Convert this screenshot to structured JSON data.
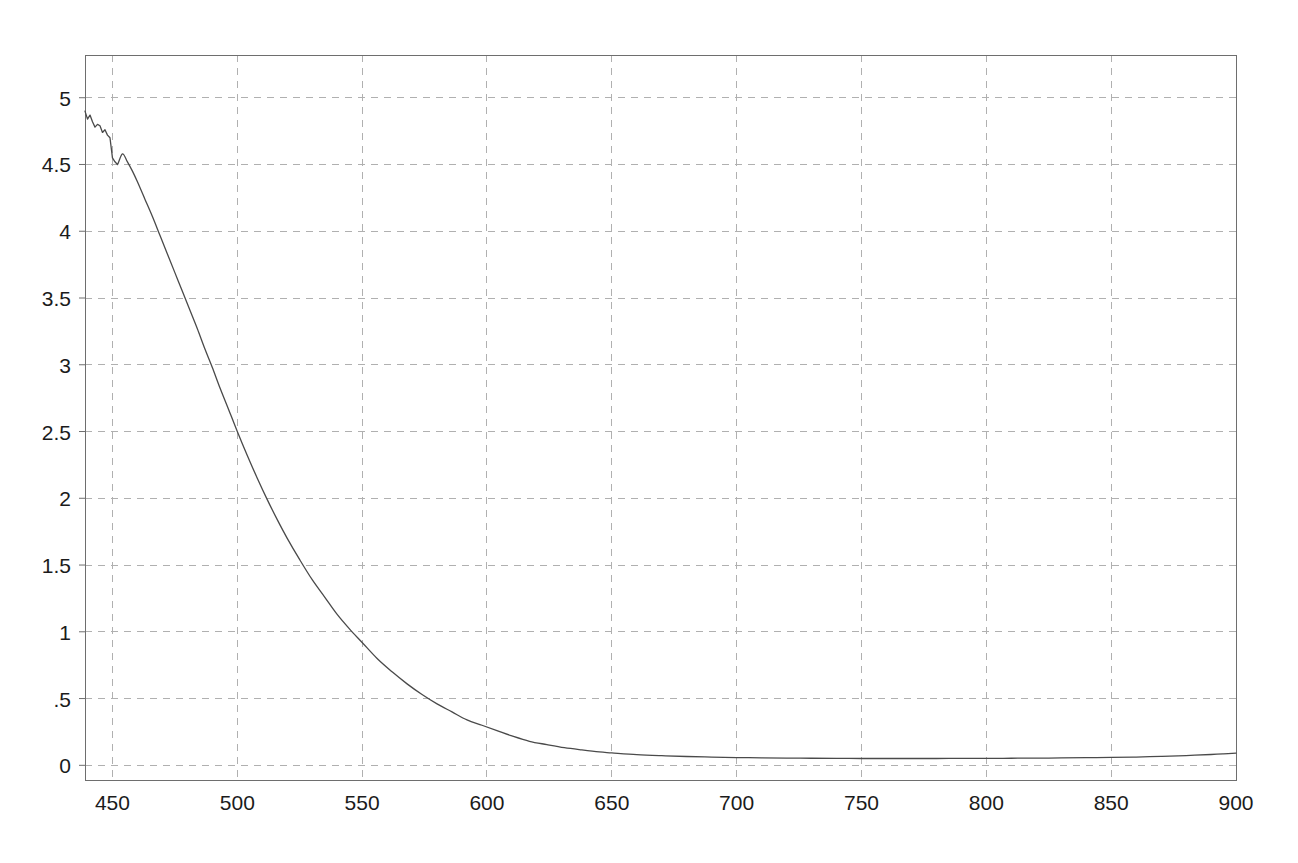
{
  "chart_data": {
    "type": "line",
    "title": "",
    "subtitle": "",
    "xlabel": "",
    "ylabel": "",
    "xlim": [
      439,
      900
    ],
    "ylim": [
      -0.11,
      5.32
    ],
    "grid": true,
    "grid_style": "dashed",
    "grid_color": "#b0b0b0",
    "legend": "none",
    "line_color": "#4a4a4a",
    "line_width": 1.3,
    "background": "#ffffff",
    "frame_color": "#6e6e6e",
    "xticks": [
      450,
      500,
      550,
      600,
      650,
      700,
      750,
      800,
      850,
      900
    ],
    "xtick_labels": [
      "450",
      "500",
      "550",
      "600",
      "650",
      "700",
      "750",
      "800",
      "850",
      "900"
    ],
    "yticks": [
      0,
      0.5,
      1,
      1.5,
      2,
      2.5,
      3,
      3.5,
      4,
      4.5,
      5
    ],
    "ytick_labels": [
      "0",
      ".5",
      "1",
      "1.5",
      "2",
      "2.5",
      "3",
      "3.5",
      "4",
      "4.5",
      "5"
    ],
    "series": [
      {
        "name": "spectrum",
        "x": [
          439,
          441,
          443,
          445,
          447,
          449,
          450,
          452,
          454,
          456,
          458,
          460,
          463,
          466,
          469,
          472,
          475,
          478,
          481,
          484,
          487,
          490,
          493,
          496,
          500,
          504,
          508,
          512,
          516,
          520,
          525,
          530,
          535,
          540,
          545,
          550,
          556,
          562,
          568,
          574,
          580,
          586,
          592,
          598,
          604,
          610,
          617,
          624,
          631,
          638,
          645,
          650,
          660,
          670,
          680,
          690,
          700,
          710,
          720,
          730,
          740,
          750,
          760,
          770,
          780,
          790,
          800,
          810,
          820,
          830,
          840,
          850,
          860,
          870,
          880,
          890,
          895,
          900
        ],
        "y": [
          4.9,
          4.86,
          4.8,
          4.79,
          4.76,
          4.7,
          4.64,
          4.62,
          4.58,
          4.52,
          4.45,
          4.37,
          4.24,
          4.11,
          3.97,
          3.83,
          3.69,
          3.55,
          3.41,
          3.27,
          3.12,
          2.98,
          2.83,
          2.69,
          2.5,
          2.32,
          2.15,
          1.99,
          1.84,
          1.7,
          1.54,
          1.39,
          1.26,
          1.13,
          1.02,
          0.92,
          0.8,
          0.7,
          0.61,
          0.53,
          0.46,
          0.4,
          0.34,
          0.3,
          0.26,
          0.22,
          0.18,
          0.155,
          0.132,
          0.115,
          0.1,
          0.093,
          0.08,
          0.072,
          0.066,
          0.062,
          0.058,
          0.056,
          0.054,
          0.053,
          0.052,
          0.051,
          0.051,
          0.051,
          0.051,
          0.052,
          0.052,
          0.053,
          0.054,
          0.055,
          0.057,
          0.059,
          0.062,
          0.067,
          0.073,
          0.081,
          0.086,
          0.092
        ]
      }
    ],
    "noise_segment": {
      "description": "small oscillations on the rising-left edge between 439 and 452 nm",
      "x": [
        439,
        440,
        441,
        442,
        443,
        444,
        445,
        446,
        447,
        448,
        449,
        450,
        451,
        452
      ],
      "y": [
        4.9,
        4.84,
        4.87,
        4.82,
        4.78,
        4.8,
        4.79,
        4.74,
        4.76,
        4.72,
        4.7,
        4.55,
        4.52,
        4.5
      ]
    }
  },
  "chart": {
    "plot_area": {
      "left": 85,
      "top": 55,
      "right": 1236,
      "bottom": 780
    }
  }
}
